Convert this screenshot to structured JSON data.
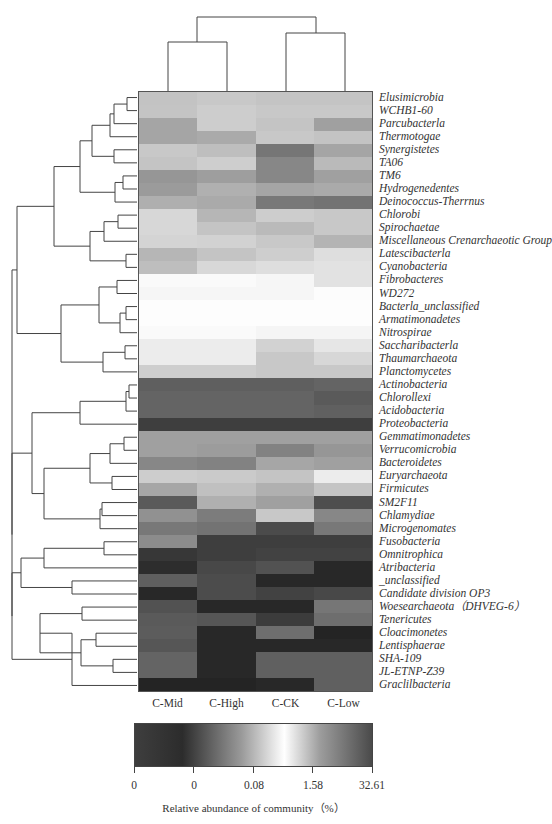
{
  "chart_data": {
    "type": "heatmap",
    "title": "",
    "columns": [
      "C-Mid",
      "C-High",
      "C-CK",
      "C-Low"
    ],
    "rows": [
      "Elusimicrobia",
      "WCHB1-60",
      "Parcubacterla",
      "Thermotogae",
      "Synergistetes",
      "TA06",
      "TM6",
      "Hydrogenedentes",
      "Deinococcus-Therrnus",
      "Chlorobi",
      "Spirochaetae",
      "Miscellaneous Crenarchaeotic Group",
      "Latescibacterla",
      "Cyanobacteria",
      "Fibrobacteres",
      "WD272",
      "Bacterla_unclassified",
      "Armatimonadetes",
      "Nitrospirae",
      "Saccharibacterla",
      "Thaumarchaeota",
      "Planctomycetes",
      "Actinobacteria",
      "Chlorollexi",
      "Acidobacteria",
      "Proteobacteria",
      "Gemmatimonadetes",
      "Verrucomicrobia",
      "Bacteroidetes",
      "Euryarchaeota",
      "Firmicutes",
      "SM2F11",
      "Chlamydiae",
      "Microgenomates",
      "Fusobacteria",
      "Omnitrophica",
      "Atribacteria",
      "_unclassified",
      "Candidate division OP3",
      "Woesearchaeota（DHVEG-6）",
      "Tenericutes",
      "Cloacimonetes",
      "Lentisphaerae",
      "SHA-109",
      "JL-ETNP-Z39",
      "Graclilbacteria"
    ],
    "gray_levels_note": "Estimated cell gray level (0=black, 255=white) per row for [C-Mid, C-High, C-CK, C-Low]",
    "gray_levels": [
      [
        195,
        200,
        196,
        196
      ],
      [
        196,
        205,
        200,
        200
      ],
      [
        165,
        205,
        196,
        160
      ],
      [
        165,
        170,
        200,
        195
      ],
      [
        200,
        190,
        118,
        165
      ],
      [
        196,
        206,
        135,
        186
      ],
      [
        150,
        158,
        135,
        160
      ],
      [
        155,
        176,
        165,
        170
      ],
      [
        175,
        170,
        120,
        115
      ],
      [
        215,
        182,
        205,
        200
      ],
      [
        215,
        196,
        186,
        200
      ],
      [
        212,
        210,
        200,
        180
      ],
      [
        182,
        196,
        206,
        222
      ],
      [
        190,
        216,
        222,
        226
      ],
      [
        250,
        250,
        246,
        226
      ],
      [
        246,
        246,
        246,
        252
      ],
      [
        253,
        253,
        253,
        253
      ],
      [
        253,
        253,
        253,
        253
      ],
      [
        250,
        250,
        245,
        245
      ],
      [
        236,
        236,
        210,
        230
      ],
      [
        236,
        236,
        200,
        215
      ],
      [
        206,
        206,
        200,
        200
      ],
      [
        95,
        95,
        95,
        100
      ],
      [
        100,
        100,
        100,
        90
      ],
      [
        100,
        100,
        100,
        96
      ],
      [
        62,
        62,
        62,
        62
      ],
      [
        160,
        160,
        160,
        160
      ],
      [
        160,
        156,
        130,
        150
      ],
      [
        135,
        130,
        166,
        160
      ],
      [
        205,
        202,
        196,
        236
      ],
      [
        166,
        192,
        176,
        196
      ],
      [
        90,
        176,
        160,
        78
      ],
      [
        145,
        124,
        200,
        135
      ],
      [
        120,
        115,
        75,
        120
      ],
      [
        140,
        62,
        62,
        62
      ],
      [
        55,
        62,
        66,
        66
      ],
      [
        45,
        72,
        82,
        40
      ],
      [
        95,
        76,
        40,
        40
      ],
      [
        40,
        76,
        66,
        72
      ],
      [
        82,
        40,
        40,
        118
      ],
      [
        90,
        86,
        60,
        110
      ],
      [
        92,
        40,
        110,
        36
      ],
      [
        86,
        40,
        40,
        40
      ],
      [
        100,
        40,
        96,
        96
      ],
      [
        100,
        40,
        96,
        96
      ],
      [
        36,
        36,
        40,
        96
      ]
    ],
    "colorbar": {
      "label": "Relative abundance of community（%）",
      "ticks": [
        "0",
        "0",
        "0.08",
        "1.58",
        "32.61"
      ],
      "gradient_stops": [
        {
          "pos": 0,
          "color": "#3e3e3e"
        },
        {
          "pos": 0.2,
          "color": "#2c2c2c"
        },
        {
          "pos": 0.45,
          "color": "#9a9a9a"
        },
        {
          "pos": 0.63,
          "color": "#ffffff"
        },
        {
          "pos": 0.78,
          "color": "#9d9d9d"
        },
        {
          "pos": 1,
          "color": "#4a4a4a"
        }
      ]
    },
    "column_dendrogram": "((C-Mid, C-High), (C-CK, C-Low))",
    "row_dendrogram": "hierarchical clustering tree shown on left",
    "grid": false
  }
}
